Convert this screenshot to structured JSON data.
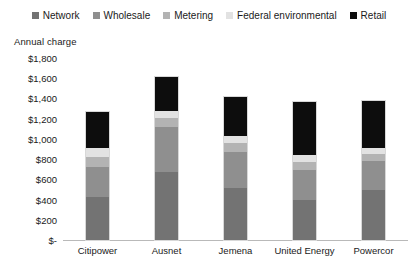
{
  "chart_data": {
    "type": "bar",
    "stacked": true,
    "title": "",
    "xlabel": "",
    "ylabel": "Annual charge",
    "ylim": [
      0,
      1800
    ],
    "ytick_values": [
      0,
      200,
      400,
      600,
      800,
      1000,
      1200,
      1400,
      1600,
      1800
    ],
    "ytick_labels": [
      "$-",
      "$200",
      "$400",
      "$600",
      "$800",
      "$1,000",
      "$1,200",
      "$1,400",
      "$1,600",
      "$1,800"
    ],
    "grid": false,
    "legend_position": "top",
    "categories": [
      "Citipower",
      "Ausnet",
      "Jemena",
      "United Energy",
      "Powercor"
    ],
    "series": [
      {
        "name": "Network",
        "color": "#737373",
        "values": [
          430,
          670,
          510,
          395,
          490
        ]
      },
      {
        "name": "Wholesale",
        "color": "#8f8f8f",
        "values": [
          290,
          445,
          365,
          295,
          295
        ]
      },
      {
        "name": "Metering",
        "color": "#b3b3b3",
        "values": [
          98,
          88,
          89,
          79,
          69
        ]
      },
      {
        "name": "Federal environmental",
        "color": "#e2e2e2",
        "values": [
          89,
          69,
          69,
          69,
          59
        ]
      },
      {
        "name": "Retail",
        "color": "#0d0d0d",
        "values": [
          363,
          344,
          384,
          532,
          463
        ]
      }
    ],
    "totals": [
      1270,
      1616,
      1417,
      1370,
      1376
    ]
  },
  "legend": {
    "items": [
      {
        "label": "Network",
        "swatch": "#737373"
      },
      {
        "label": "Wholesale",
        "swatch": "#8f8f8f"
      },
      {
        "label": "Metering",
        "swatch": "#b3b3b3"
      },
      {
        "label": "Federal environmental",
        "swatch": "#e2e2e2"
      },
      {
        "label": "Retail",
        "swatch": "#0d0d0d"
      }
    ]
  }
}
